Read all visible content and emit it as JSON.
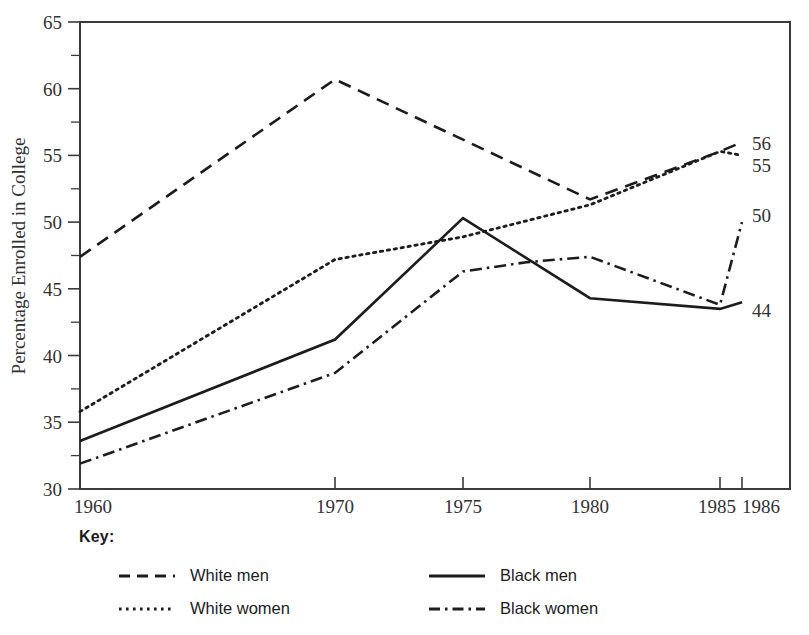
{
  "chart_data": {
    "type": "line",
    "title": "",
    "subtitle": "",
    "xlabel": "",
    "ylabel": "Percentage Enrolled in College",
    "ylim": [
      30,
      65
    ],
    "ytick_labels": [
      "30",
      "35",
      "40",
      "45",
      "50",
      "55",
      "60",
      "65"
    ],
    "ytick_values": [
      30,
      35,
      40,
      45,
      50,
      55,
      60,
      65
    ],
    "yminor_values": [
      32.5,
      37.5,
      42.5,
      47.5,
      52.5,
      57.5,
      62.5
    ],
    "xtick_labels": [
      "1960",
      "1970",
      "1975",
      "1980",
      "1985",
      "1986"
    ],
    "xtick_values": [
      1960,
      1970,
      1975,
      1980,
      1985,
      1986
    ],
    "xlim": [
      1960,
      1986
    ],
    "grid": false,
    "legend_position": "below",
    "legend_title": "Key:",
    "end_labels": [
      {
        "text": "56",
        "value": 56,
        "series": "White men"
      },
      {
        "text": "55",
        "value": 55,
        "series": "White women"
      },
      {
        "text": "50",
        "value": 50,
        "series": "Black women"
      },
      {
        "text": "44",
        "value": 44,
        "series": "Black men"
      }
    ],
    "series": [
      {
        "name": "White men",
        "style": "dashed",
        "x": [
          1960,
          1970,
          1980,
          1985,
          1986
        ],
        "values": [
          47.4,
          60.7,
          51.7,
          55.3,
          56.0
        ]
      },
      {
        "name": "White women",
        "style": "dotted",
        "x": [
          1960,
          1970,
          1975,
          1980,
          1985,
          1986
        ],
        "values": [
          35.8,
          47.2,
          48.9,
          51.3,
          55.3,
          55.0
        ]
      },
      {
        "name": "Black men",
        "style": "solid",
        "x": [
          1960,
          1970,
          1975,
          1980,
          1985,
          1986
        ],
        "values": [
          33.6,
          41.2,
          50.3,
          44.3,
          43.5,
          44.0
        ]
      },
      {
        "name": "Black women",
        "style": "dashdot",
        "x": [
          1960,
          1970,
          1975,
          1977.5,
          1980,
          1985,
          1986
        ],
        "values": [
          31.9,
          38.7,
          46.3,
          47.0,
          47.4,
          43.8,
          50.0
        ]
      }
    ]
  },
  "legend": {
    "title": "Key:",
    "entries": [
      {
        "label": "White men",
        "style": "dashed"
      },
      {
        "label": "Black men",
        "style": "solid"
      },
      {
        "label": "White women",
        "style": "dotted"
      },
      {
        "label": "Black women",
        "style": "dashdot"
      }
    ]
  },
  "axis": {
    "y_title": "Percentage Enrolled in College"
  }
}
